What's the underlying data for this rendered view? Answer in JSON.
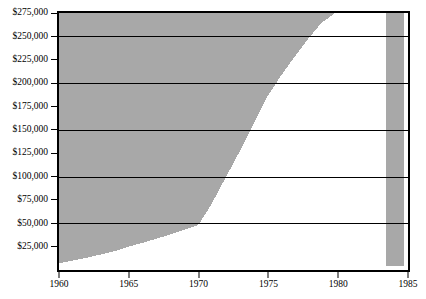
{
  "chart_data": {
    "type": "area",
    "title": "",
    "subtitle": "",
    "xlabel": "",
    "ylabel": "",
    "xlim": [
      1960,
      1985
    ],
    "ylim": [
      0,
      275000
    ],
    "grid": true,
    "legend": null,
    "fill_style": "inverted-gray-above-curve",
    "colors": {
      "area_fill": "#a8a8a8",
      "below_curve": "#ffffff",
      "axis": "#000000",
      "gridline": "#000000",
      "no_data_band": "#a8a8a8"
    },
    "y_ticks": [
      25000,
      50000,
      75000,
      100000,
      125000,
      150000,
      175000,
      200000,
      225000,
      250000,
      275000
    ],
    "y_tick_labels": [
      "$25,000",
      "$50,000",
      "$75,000",
      "$100,000",
      "$125,000",
      "$150,000",
      "$175,000",
      "$200,000",
      "$225,000",
      "$250,000",
      "$275,000"
    ],
    "y_gridlines": [
      50000,
      100000,
      150000,
      200000,
      250000
    ],
    "x_ticks": [
      1960,
      1965,
      1970,
      1975,
      1980,
      1985
    ],
    "x_tick_labels": [
      "1960",
      "1965",
      "1970",
      "1975",
      "1980",
      "1985"
    ],
    "data_end_x": 1983.7,
    "no_data_region": [
      1983.7,
      1985
    ],
    "x": [
      1960,
      1962,
      1964,
      1965,
      1966,
      1968,
      1970,
      1970.2,
      1971,
      1972,
      1973,
      1974,
      1975,
      1976,
      1977,
      1978,
      1979,
      1980,
      1983.7
    ],
    "values": [
      3000,
      9000,
      16000,
      21000,
      25000,
      34000,
      44000,
      47000,
      66000,
      94000,
      122000,
      152000,
      182000,
      205000,
      226000,
      246000,
      264000,
      275000,
      275000
    ],
    "series": [
      {
        "name": "value",
        "values": [
          3000,
          9000,
          16000,
          21000,
          25000,
          34000,
          44000,
          47000,
          66000,
          94000,
          122000,
          152000,
          182000,
          205000,
          226000,
          246000,
          264000,
          275000,
          275000
        ]
      }
    ]
  }
}
